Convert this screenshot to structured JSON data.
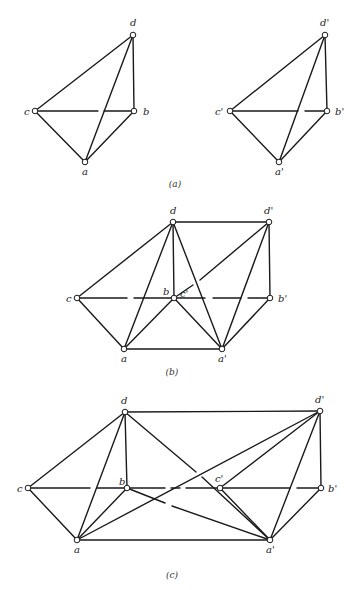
{
  "figure": {
    "panels": [
      {
        "id": "a",
        "caption": "(a)",
        "caption_pos": [
          175,
          187
        ],
        "nodes": [
          {
            "id": "d",
            "label": "d",
            "x": 133,
            "y": 35,
            "lx": 130,
            "ly": 26
          },
          {
            "id": "c",
            "label": "c",
            "x": 35,
            "y": 111,
            "lx": 24,
            "ly": 115
          },
          {
            "id": "b",
            "label": "b",
            "x": 134,
            "y": 111,
            "lx": 143,
            "ly": 115
          },
          {
            "id": "a",
            "label": "a",
            "x": 85,
            "y": 162,
            "lx": 82,
            "ly": 175
          },
          {
            "id": "d'",
            "label": "d'",
            "x": 325,
            "y": 35,
            "lx": 320,
            "ly": 26
          },
          {
            "id": "c'",
            "label": "c'",
            "x": 230,
            "y": 111,
            "lx": 215,
            "ly": 115
          },
          {
            "id": "b'",
            "label": "b'",
            "x": 327,
            "y": 111,
            "lx": 335,
            "ly": 115
          },
          {
            "id": "a'",
            "label": "a'",
            "x": 279,
            "y": 162,
            "lx": 275,
            "ly": 175
          }
        ],
        "edges": [
          [
            [
              35,
              111
            ],
            [
              133,
              35
            ]
          ],
          [
            [
              133,
              35
            ],
            [
              134,
              111
            ]
          ],
          [
            [
              35,
              111
            ],
            [
              85,
              162
            ]
          ],
          [
            [
              85,
              162
            ],
            [
              134,
              111
            ]
          ],
          [
            [
              85,
              162
            ],
            [
              133,
              35
            ]
          ],
          [
            [
              35,
              111
            ],
            [
              98,
              111
            ]
          ],
          [
            [
              104,
              111
            ],
            [
              134,
              111
            ]
          ],
          [
            [
              230,
              111
            ],
            [
              325,
              35
            ]
          ],
          [
            [
              325,
              35
            ],
            [
              327,
              111
            ]
          ],
          [
            [
              230,
              111
            ],
            [
              279,
              162
            ]
          ],
          [
            [
              279,
              162
            ],
            [
              327,
              111
            ]
          ],
          [
            [
              279,
              162
            ],
            [
              325,
              35
            ]
          ],
          [
            [
              230,
              111
            ],
            [
              298,
              111
            ]
          ],
          [
            [
              305,
              111
            ],
            [
              327,
              111
            ]
          ]
        ]
      },
      {
        "id": "b",
        "caption": "(b)",
        "caption_pos": [
          172,
          375
        ],
        "nodes": [
          {
            "id": "d",
            "label": "d",
            "x": 173,
            "y": 222,
            "lx": 170,
            "ly": 214
          },
          {
            "id": "d'",
            "label": "d'",
            "x": 269,
            "y": 222,
            "lx": 264,
            "ly": 214
          },
          {
            "id": "c",
            "label": "c",
            "x": 77,
            "y": 298,
            "lx": 66,
            "ly": 302
          },
          {
            "id": "b",
            "label": "b",
            "x": 174,
            "y": 298,
            "lx": 163,
            "ly": 295
          },
          {
            "id": "c'",
            "label": "c'",
            "x": 174,
            "y": 298,
            "lx": 180,
            "ly": 297
          },
          {
            "id": "b'",
            "label": "b'",
            "x": 270,
            "y": 298,
            "lx": 278,
            "ly": 302
          },
          {
            "id": "a",
            "label": "a",
            "x": 124,
            "y": 349,
            "lx": 121,
            "ly": 362
          },
          {
            "id": "a'",
            "label": "a'",
            "x": 222,
            "y": 349,
            "lx": 218,
            "ly": 362
          }
        ],
        "edges": [
          [
            [
              173,
              222
            ],
            [
              269,
              222
            ]
          ],
          [
            [
              77,
              298
            ],
            [
              173,
              222
            ]
          ],
          [
            [
              173,
              222
            ],
            [
              174,
              298
            ]
          ],
          [
            [
              124,
              349
            ],
            [
              173,
              222
            ]
          ],
          [
            [
              173,
              222
            ],
            [
              222,
              349
            ]
          ],
          [
            [
              77,
              298
            ],
            [
              124,
              349
            ]
          ],
          [
            [
              124,
              349
            ],
            [
              174,
              298
            ]
          ],
          [
            [
              174,
              298
            ],
            [
              222,
              349
            ]
          ],
          [
            [
              124,
              349
            ],
            [
              222,
              349
            ]
          ],
          [
            [
              269,
              222
            ],
            [
              270,
              298
            ]
          ],
          [
            [
              222,
              349
            ],
            [
              269,
              222
            ]
          ],
          [
            [
              222,
              349
            ],
            [
              270,
              298
            ]
          ],
          [
            [
              174,
              298
            ],
            [
              193,
              285
            ]
          ],
          [
            [
              200,
              280
            ],
            [
              269,
              222
            ]
          ],
          [
            [
              77,
              298
            ],
            [
              127,
              298
            ]
          ],
          [
            [
              134,
              298
            ],
            [
              174,
              298
            ]
          ],
          [
            [
              174,
              298
            ],
            [
              205,
              298
            ]
          ],
          [
            [
              213,
              298
            ],
            [
              241,
              298
            ]
          ],
          [
            [
              248,
              298
            ],
            [
              270,
              298
            ]
          ]
        ]
      },
      {
        "id": "c",
        "caption": "(c)",
        "caption_pos": [
          172,
          578
        ],
        "nodes": [
          {
            "id": "d",
            "label": "d",
            "x": 125,
            "y": 412,
            "lx": 121,
            "ly": 404
          },
          {
            "id": "d'",
            "label": "d'",
            "x": 320,
            "y": 411,
            "lx": 315,
            "ly": 403
          },
          {
            "id": "c",
            "label": "c",
            "x": 28,
            "y": 488,
            "lx": 17,
            "ly": 492
          },
          {
            "id": "b",
            "label": "b",
            "x": 127,
            "y": 488,
            "lx": 119,
            "ly": 485
          },
          {
            "id": "c'",
            "label": "c'",
            "x": 220,
            "y": 488,
            "lx": 215,
            "ly": 482
          },
          {
            "id": "b'",
            "label": "b'",
            "x": 321,
            "y": 488,
            "lx": 328,
            "ly": 492
          },
          {
            "id": "a",
            "label": "a",
            "x": 77,
            "y": 540,
            "lx": 74,
            "ly": 553
          },
          {
            "id": "a'",
            "label": "a'",
            "x": 270,
            "y": 540,
            "lx": 266,
            "ly": 553
          }
        ],
        "edges": [
          [
            [
              125,
              412
            ],
            [
              320,
              411
            ]
          ],
          [
            [
              28,
              488
            ],
            [
              125,
              412
            ]
          ],
          [
            [
              125,
              412
            ],
            [
              127,
              488
            ]
          ],
          [
            [
              77,
              540
            ],
            [
              125,
              412
            ]
          ],
          [
            [
              28,
              488
            ],
            [
              77,
              540
            ]
          ],
          [
            [
              77,
              540
            ],
            [
              127,
              488
            ]
          ],
          [
            [
              77,
              540
            ],
            [
              270,
              540
            ]
          ],
          [
            [
              77,
              540
            ],
            [
              320,
              411
            ]
          ],
          [
            [
              125,
              412
            ],
            [
              196,
              472
            ]
          ],
          [
            [
              202,
              477
            ],
            [
              270,
              540
            ]
          ],
          [
            [
              127,
              488
            ],
            [
              165,
              503
            ]
          ],
          [
            [
              172,
              506
            ],
            [
              270,
              540
            ]
          ],
          [
            [
              220,
              488
            ],
            [
              270,
              540
            ]
          ],
          [
            [
              220,
              488
            ],
            [
              320,
              411
            ]
          ],
          [
            [
              270,
              540
            ],
            [
              320,
              411
            ]
          ],
          [
            [
              270,
              540
            ],
            [
              321,
              488
            ]
          ],
          [
            [
              320,
              411
            ],
            [
              321,
              488
            ]
          ],
          [
            [
              28,
              488
            ],
            [
              90,
              488
            ]
          ],
          [
            [
              97,
              488
            ],
            [
              127,
              488
            ]
          ],
          [
            [
              127,
              488
            ],
            [
              165,
              488
            ]
          ],
          [
            [
              171,
              488
            ],
            [
              180,
              488
            ]
          ],
          [
            [
              186,
              488
            ],
            [
              220,
              488
            ]
          ],
          [
            [
              220,
              488
            ],
            [
              290,
              488
            ]
          ],
          [
            [
              297,
              488
            ],
            [
              321,
              488
            ]
          ]
        ]
      }
    ]
  }
}
